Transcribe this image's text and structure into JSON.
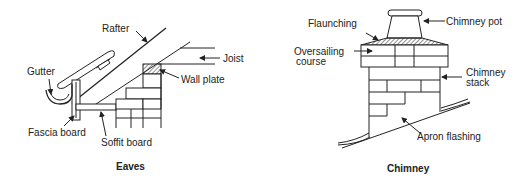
{
  "eaves": {
    "caption": "Eaves",
    "labels": {
      "rafter": "Rafter",
      "joist": "Joist",
      "gutter": "Gutter",
      "wall_plate": "Wall plate",
      "fascia_board": "Fascia board",
      "soffit_board": "Soffit board"
    }
  },
  "chimney": {
    "caption": "Chimney",
    "labels": {
      "flaunching": "Flaunching",
      "chimney_pot": "Chimney pot",
      "oversailing_line1": "Oversailing",
      "oversailing_line2": "course",
      "chimney_stack_line1": "Chimney",
      "chimney_stack_line2": "stack",
      "apron_flashing": "Apron flashing"
    }
  }
}
